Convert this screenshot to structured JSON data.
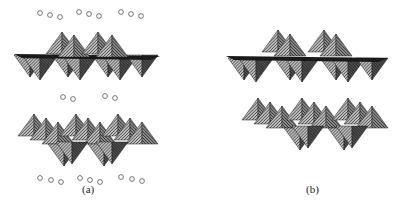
{
  "figure": {
    "panels": [
      {
        "id": "a",
        "label": "(a)",
        "layers": 2,
        "interlayer_species": "open circles (ions/molecules) between and outside layers",
        "circle_rows": [
          {
            "y": 14,
            "groups": [
              [
                38,
                50,
                60
              ],
              [
                79,
                89,
                99
              ],
              [
                121,
                131,
                141
              ]
            ]
          },
          {
            "y": 97,
            "groups": [
              [
                63,
                73
              ],
              [
                105,
                115
              ]
            ]
          },
          {
            "y": 180,
            "groups": [
              [
                40,
                51,
                61
              ],
              [
                80,
                90,
                100
              ],
              [
                121,
                132,
                142
              ]
            ]
          }
        ]
      },
      {
        "id": "b",
        "label": "(b)",
        "layers": 2,
        "interlayer_species": "none"
      }
    ],
    "colors": {
      "face_light": "#9a9a9a",
      "face_dark": "#3a3a3a",
      "hatch": "#222222",
      "circle_stroke": "#555555"
    }
  }
}
